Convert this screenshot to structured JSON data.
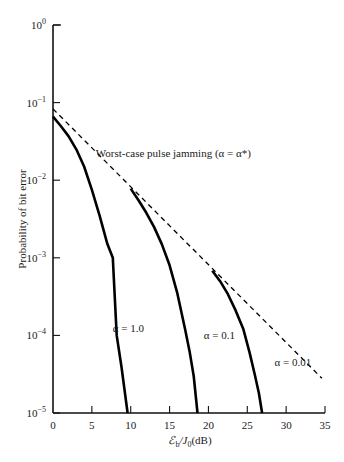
{
  "chart_data": {
    "type": "line",
    "title": "",
    "xlabel": "ℰb/J0(dB)",
    "xlabel_parts": {
      "main": "ℰ",
      "sub1": "b",
      "mid": "/J",
      "sub2": "0",
      "tail": "(dB)"
    },
    "ylabel": "Probability of bit error",
    "xlim": [
      0,
      35
    ],
    "ylim": [
      1e-05,
      1
    ],
    "yscale": "log",
    "x_ticks": [
      0,
      5,
      10,
      15,
      20,
      25,
      30,
      35
    ],
    "x_tick_labels": [
      "0",
      "5",
      "10",
      "15",
      "20",
      "25",
      "30",
      "35"
    ],
    "y_ticks": [
      1,
      0.1,
      0.01,
      0.001,
      0.0001,
      1e-05
    ],
    "y_tick_labels": [
      {
        "base": "10",
        "exp": "0"
      },
      {
        "base": "10",
        "exp": "−1"
      },
      {
        "base": "10",
        "exp": "−2"
      },
      {
        "base": "10",
        "exp": "−3"
      },
      {
        "base": "10",
        "exp": "−4"
      },
      {
        "base": "10",
        "exp": "−5"
      }
    ],
    "grid": false,
    "series": [
      {
        "name": "α = 1.0",
        "style": "solid",
        "x": [
          0,
          1,
          2,
          3,
          4,
          5,
          6,
          7,
          7.7,
          8.2,
          8.8,
          9.6
        ],
        "y": [
          0.066,
          0.05,
          0.037,
          0.025,
          0.015,
          0.0075,
          0.0035,
          0.0015,
          0.001,
          0.0001,
          4e-05,
          1e-05
        ]
      },
      {
        "name": "α = 0.1",
        "style": "solid",
        "x": [
          10,
          11,
          12,
          13,
          14,
          15,
          16,
          17,
          17.6,
          18.1,
          18.6
        ],
        "y": [
          0.0078,
          0.0055,
          0.0038,
          0.0025,
          0.0015,
          0.0008,
          0.00035,
          0.00012,
          6e-05,
          3e-05,
          1e-05
        ]
      },
      {
        "name": "α = 0.01",
        "style": "solid",
        "x": [
          20.5,
          21.5,
          22.5,
          23.5,
          24.5,
          25.3,
          26,
          26.5,
          26.9
        ],
        "y": [
          0.00068,
          0.0005,
          0.00034,
          0.00021,
          0.00012,
          6e-05,
          3e-05,
          1.8e-05,
          1e-05
        ]
      },
      {
        "name": "Worst-case pulse jamming (α = α*)",
        "style": "dashed",
        "x": [
          0,
          34.6
        ],
        "y": [
          0.083,
          2.8e-05
        ]
      }
    ],
    "annotations": [
      {
        "text": "Worst-case pulse jamming (α = α*)",
        "x": 5.5,
        "y": 0.02
      },
      {
        "text": "α = 1.0",
        "x": 7.7,
        "y": 0.00011
      },
      {
        "text": "α = 0.1",
        "x": 19.4,
        "y": 9e-05
      },
      {
        "text": "α = 0.01",
        "x": 28.5,
        "y": 4e-05
      }
    ],
    "legend": "none"
  }
}
